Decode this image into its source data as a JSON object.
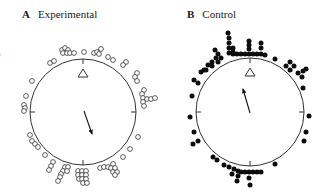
{
  "panels": [
    {
      "letter": "A",
      "title": "Experimental",
      "marker": "open",
      "circle": {
        "cx": 83,
        "cy": 112,
        "r": 53
      },
      "arrow": {
        "x1": 84,
        "y1": 111,
        "x2": 92,
        "y2": 134
      },
      "reference": "triangle",
      "points": [
        [
          62,
          50
        ],
        [
          65,
          48
        ],
        [
          68,
          50
        ],
        [
          63,
          53
        ],
        [
          67,
          53
        ],
        [
          70,
          53
        ],
        [
          74,
          53
        ],
        [
          84,
          52
        ],
        [
          94,
          53
        ],
        [
          97,
          52
        ],
        [
          101,
          49
        ],
        [
          99,
          54
        ],
        [
          108,
          57
        ],
        [
          113,
          60
        ],
        [
          126,
          62
        ],
        [
          123,
          65
        ],
        [
          50,
          63
        ],
        [
          54,
          61
        ],
        [
          137,
          73
        ],
        [
          135,
          77
        ],
        [
          137,
          81
        ],
        [
          144,
          90
        ],
        [
          142,
          94
        ],
        [
          143,
          98
        ],
        [
          147,
          99
        ],
        [
          151,
          99
        ],
        [
          155,
          98
        ],
        [
          143,
          102
        ],
        [
          144,
          106
        ],
        [
          32,
          81
        ],
        [
          26,
          96
        ],
        [
          24,
          105
        ],
        [
          25,
          108
        ],
        [
          24,
          111
        ],
        [
          30,
          135
        ],
        [
          32,
          141
        ],
        [
          35,
          144
        ],
        [
          38,
          147
        ],
        [
          45,
          155
        ],
        [
          53,
          162
        ],
        [
          51,
          166
        ],
        [
          49,
          170
        ],
        [
          65,
          167
        ],
        [
          68,
          167
        ],
        [
          63,
          171
        ],
        [
          61,
          174
        ],
        [
          60,
          177
        ],
        [
          58,
          181
        ],
        [
          67,
          171
        ],
        [
          78,
          171
        ],
        [
          82,
          171
        ],
        [
          86,
          171
        ],
        [
          78,
          175
        ],
        [
          82,
          175
        ],
        [
          86,
          175
        ],
        [
          79,
          179
        ],
        [
          82,
          179
        ],
        [
          86,
          179
        ],
        [
          83,
          183
        ],
        [
          87,
          183
        ],
        [
          100,
          168
        ],
        [
          104,
          167
        ],
        [
          108,
          167
        ],
        [
          113,
          164
        ],
        [
          111,
          168
        ],
        [
          115,
          168
        ],
        [
          113,
          172
        ],
        [
          117,
          172
        ],
        [
          115,
          175
        ],
        [
          123,
          157
        ],
        [
          130,
          149
        ],
        [
          138,
          137
        ]
      ]
    },
    {
      "letter": "B",
      "title": "Control",
      "marker": "filled",
      "circle": {
        "cx": 250,
        "cy": 112,
        "r": 54
      },
      "arrow": {
        "x1": 250,
        "y1": 113,
        "x2": 243,
        "y2": 89
      },
      "reference": "triangle",
      "points": [
        [
          228,
          33
        ],
        [
          229,
          38
        ],
        [
          229,
          43
        ],
        [
          229,
          48
        ],
        [
          229,
          53
        ],
        [
          233,
          54
        ],
        [
          237,
          54
        ],
        [
          241,
          54
        ],
        [
          245,
          54
        ],
        [
          249,
          54
        ],
        [
          253,
          54
        ],
        [
          257,
          54
        ],
        [
          261,
          54
        ],
        [
          265,
          55
        ],
        [
          233,
          48
        ],
        [
          249,
          41
        ],
        [
          249,
          45
        ],
        [
          249,
          49
        ],
        [
          261,
          43
        ],
        [
          261,
          48
        ],
        [
          233,
          52
        ],
        [
          215,
          50
        ],
        [
          218,
          54
        ],
        [
          221,
          58
        ],
        [
          216,
          58
        ],
        [
          212,
          62
        ],
        [
          208,
          65
        ],
        [
          204,
          70
        ],
        [
          201,
          72
        ],
        [
          206,
          70
        ],
        [
          212,
          66
        ],
        [
          218,
          62
        ],
        [
          194,
          80
        ],
        [
          198,
          83
        ],
        [
          192,
          96
        ],
        [
          275,
          59
        ],
        [
          290,
          62
        ],
        [
          294,
          66
        ],
        [
          290,
          70
        ],
        [
          286,
          66
        ],
        [
          298,
          73
        ],
        [
          303,
          71
        ],
        [
          306,
          69
        ],
        [
          302,
          77
        ],
        [
          303,
          88
        ],
        [
          190,
          117
        ],
        [
          194,
          132
        ],
        [
          193,
          144
        ],
        [
          198,
          141
        ],
        [
          213,
          157
        ],
        [
          217,
          160
        ],
        [
          224,
          165
        ],
        [
          229,
          167
        ],
        [
          234,
          169
        ],
        [
          238,
          171
        ],
        [
          241,
          172
        ],
        [
          245,
          172
        ],
        [
          249,
          172
        ],
        [
          253,
          172
        ],
        [
          257,
          172
        ],
        [
          261,
          172
        ],
        [
          232,
          174
        ],
        [
          238,
          176
        ],
        [
          237,
          181
        ],
        [
          249,
          178
        ],
        [
          250,
          185
        ],
        [
          309,
          116
        ],
        [
          306,
          132
        ],
        [
          304,
          141
        ],
        [
          275,
          164
        ]
      ]
    }
  ],
  "artifact_text": "e"
}
